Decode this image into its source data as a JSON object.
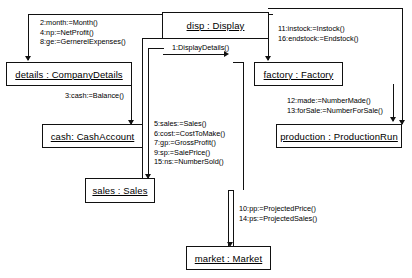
{
  "diagram": {
    "type": "uml-communication-diagram",
    "objects": [
      {
        "id": "disp",
        "label": "disp : Display"
      },
      {
        "id": "details",
        "label": "details : CompanyDetails"
      },
      {
        "id": "cash",
        "label": "cash: CashAccount"
      },
      {
        "id": "sales",
        "label": "sales : Sales"
      },
      {
        "id": "market",
        "label": "market : Market"
      },
      {
        "id": "factory",
        "label": "factory : Factory"
      },
      {
        "id": "production",
        "label": "production : ProductionRun"
      }
    ],
    "messages": [
      {
        "group": "disp-to-details",
        "lines": [
          "2:month:=Month()",
          "4:np:=NetProfit()",
          "8:ge:=GernerelExpenses()"
        ]
      },
      {
        "group": "actor-to-disp",
        "lines": [
          "1:DisplayDetails()"
        ]
      },
      {
        "group": "details-to-cash",
        "lines": [
          "3:cash:=Balance()"
        ]
      },
      {
        "group": "disp-to-sales",
        "lines": [
          "5:sales:=Sales()",
          "6:cost:=CostToMake()",
          "7:gp:=GrossProfit()",
          "9:sp:=SalePrice()",
          "15:ns:=NumberSold()"
        ]
      },
      {
        "group": "disp-to-factory",
        "lines": [
          "11:instock:=Instock()",
          "16:endstock:=Endstock()"
        ]
      },
      {
        "group": "factory-to-prod",
        "lines": [
          "12:made:=NumberMade()",
          "13:forSale:=NumberForSale()"
        ]
      },
      {
        "group": "sales-to-market",
        "lines": [
          "10:pp:=ProjectedPrice()",
          "14:ps:=ProjectedSales()"
        ]
      }
    ],
    "colors": {
      "stroke": "#111111",
      "background": "#ffffff",
      "text": "#000000"
    }
  }
}
